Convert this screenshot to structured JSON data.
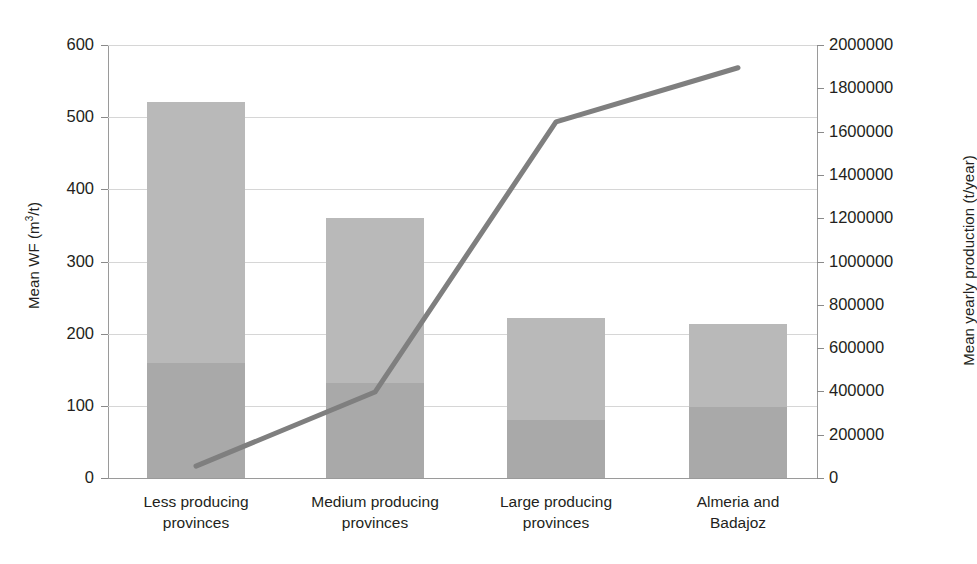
{
  "chart_data": {
    "type": "bar",
    "title": "",
    "subtitle": "",
    "categories": [
      "Less producing provinces",
      "Medium producing provinces",
      "Large producing provinces",
      "Almeria and Badajoz"
    ],
    "category_lines": [
      [
        "Less producing",
        "provinces"
      ],
      [
        "Medium producing",
        "provinces"
      ],
      [
        "Large producing",
        "provinces"
      ],
      [
        "Almeria and",
        "Badajoz"
      ]
    ],
    "xlabel": "",
    "ylabel": "Mean WF (m3/t)",
    "ylabel_parts": {
      "prefix": "Mean WF (m",
      "sup": "3",
      "suffix": "/t)"
    },
    "y2label": "Mean yearly production (t/year)",
    "ylim": [
      0,
      600
    ],
    "y2lim": [
      0,
      2000000
    ],
    "yticks": [
      0,
      100,
      200,
      300,
      400,
      500,
      600
    ],
    "ytick_labels": [
      "0",
      "100",
      "200",
      "300",
      "400",
      "500",
      "600"
    ],
    "y2ticks": [
      0,
      200000,
      400000,
      600000,
      800000,
      1000000,
      1200000,
      1400000,
      1600000,
      1800000,
      2000000
    ],
    "y2tick_labels": [
      "0",
      "200000",
      "400000",
      "600000",
      "800000",
      "1000000",
      "1200000",
      "1400000",
      "1600000",
      "1800000",
      "2000000"
    ],
    "grid": true,
    "legend": "none",
    "stacked": true,
    "series": [
      {
        "name": "Mean WF lower component",
        "axis": "left",
        "type": "bar",
        "color": "#a9a9a9",
        "values": [
          159,
          132,
          80,
          98
        ]
      },
      {
        "name": "Mean WF upper component",
        "axis": "left",
        "type": "bar",
        "color": "#b9b9b9",
        "values": [
          362,
          228,
          142,
          115
        ]
      },
      {
        "name": "Mean WF total",
        "axis": "left",
        "type": "bar-total",
        "values": [
          521,
          360,
          222,
          213
        ]
      },
      {
        "name": "Mean yearly production",
        "axis": "right",
        "type": "line",
        "color": "#7f7f7f",
        "values": [
          55000,
          397000,
          1645000,
          1895000
        ]
      }
    ]
  },
  "geometry": {
    "plot_left": 108,
    "plot_top": 45,
    "plot_width": 709,
    "plot_height": 433,
    "bar_width": 98,
    "bar_centers": [
      196,
      375,
      556,
      738
    ]
  },
  "colors": {
    "bar_upper": "#b9b9b9",
    "bar_lower": "#a9a9a9",
    "line": "#7f7f7f",
    "grid": "#d6d6d6",
    "axis": "#9a9a9a",
    "text": "#231f20"
  }
}
